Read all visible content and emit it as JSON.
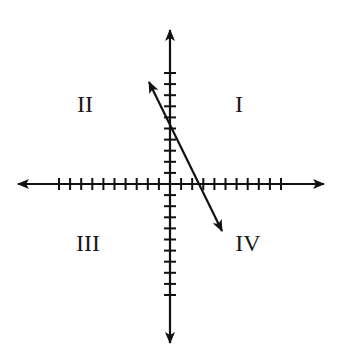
{
  "diagram": {
    "type": "coordinate-plane",
    "quadrants": [
      {
        "id": "q1",
        "label": "I",
        "x": 239,
        "y": 112
      },
      {
        "id": "q2",
        "label": "II",
        "x": 85,
        "y": 112
      },
      {
        "id": "q3",
        "label": "III",
        "x": 88,
        "y": 251
      },
      {
        "id": "q4",
        "label": "IV",
        "x": 248,
        "y": 251
      }
    ],
    "origin": {
      "x": 170,
      "y": 184
    },
    "tick_spacing": 11.1,
    "ticks_per_half_axis": 10,
    "x_axis": {
      "left": 18,
      "right": 324
    },
    "y_axis": {
      "top": 30,
      "bottom": 343
    },
    "line": {
      "x1": 149,
      "y1": 82,
      "x2": 222,
      "y2": 231,
      "y_intercept_units": 5.3,
      "x_intercept_units": 2.6,
      "slope_sign": "negative",
      "passes_through_quadrants": [
        "II",
        "I",
        "IV"
      ]
    },
    "colors": {
      "stroke": "#111111",
      "background": "#ffffff"
    }
  }
}
